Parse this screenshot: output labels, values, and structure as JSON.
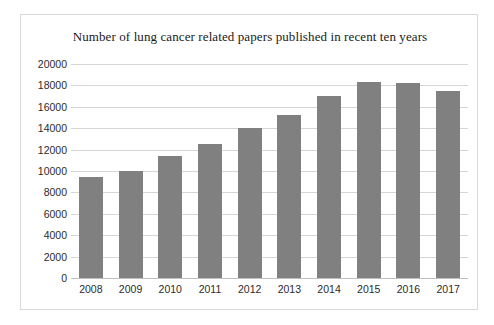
{
  "chart_data": {
    "type": "bar",
    "title": "Number of lung cancer related papers published in recent ten years",
    "xlabel": "",
    "ylabel": "",
    "categories": [
      "2008",
      "2009",
      "2010",
      "2011",
      "2012",
      "2013",
      "2014",
      "2015",
      "2016",
      "2017"
    ],
    "values": [
      9400,
      10000,
      11400,
      12500,
      14000,
      15200,
      17000,
      18300,
      18200,
      17500
    ],
    "ylim": [
      0,
      20000
    ],
    "ytick_labels": [
      "20000",
      "18000",
      "16000",
      "14000",
      "12000",
      "10000",
      "8000",
      "6000",
      "4000",
      "2000",
      "0"
    ],
    "ytick_values": [
      20000,
      18000,
      16000,
      14000,
      12000,
      10000,
      8000,
      6000,
      4000,
      2000,
      0
    ],
    "grid": true,
    "legend": "none",
    "bar_color": "#808080",
    "gridline_color": "#d6d6d6",
    "frame_color": "#d9d9d9",
    "background_color": "#ffffff"
  }
}
